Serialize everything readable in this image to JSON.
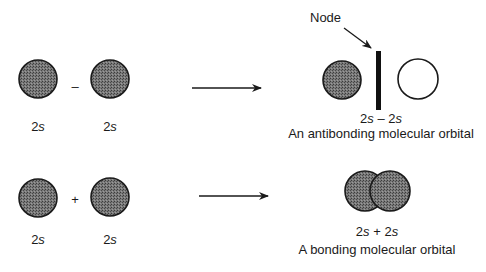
{
  "colors": {
    "orbital_fill": "#6e6e6e",
    "outline": "#1a1a1a",
    "background": "#ffffff"
  },
  "antibonding_row": {
    "left_orbital": {
      "num": "2",
      "sym": "s"
    },
    "operator": "–",
    "right_orbital": {
      "num": "2",
      "sym": "s"
    },
    "result": {
      "node_label": "Node",
      "expr_a_num": "2",
      "expr_a_sym": "s",
      "expr_op": " – ",
      "expr_b_num": "2",
      "expr_b_sym": "s",
      "caption": "An antibonding molecular orbital"
    }
  },
  "bonding_row": {
    "left_orbital": {
      "num": "2",
      "sym": "s"
    },
    "operator": "+",
    "right_orbital": {
      "num": "2",
      "sym": "s"
    },
    "result": {
      "expr_a_num": "2",
      "expr_a_sym": "s",
      "expr_op": " + ",
      "expr_b_num": "2",
      "expr_b_sym": "s",
      "caption": "A bonding molecular orbital"
    }
  }
}
